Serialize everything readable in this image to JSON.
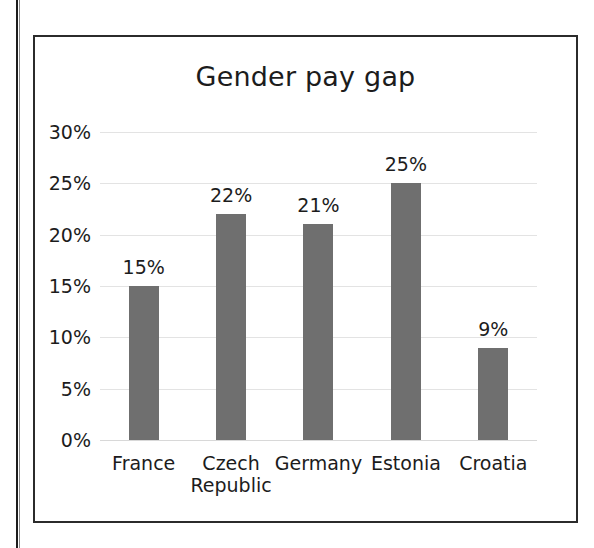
{
  "chart_data": {
    "type": "bar",
    "title": "Gender pay gap",
    "xlabel": "",
    "ylabel": "",
    "categories": [
      "France",
      "Czech Republic",
      "Germany",
      "Estonia",
      "Croatia"
    ],
    "category_lines": [
      [
        "France"
      ],
      [
        "Czech",
        "Republic"
      ],
      [
        "Germany"
      ],
      [
        "Estonia"
      ],
      [
        "Croatia"
      ]
    ],
    "values": [
      15,
      22,
      21,
      25,
      9
    ],
    "data_labels": [
      "15%",
      "22%",
      "21%",
      "25%",
      "9%"
    ],
    "ylim": [
      0,
      30
    ],
    "ytick_values": [
      30,
      25,
      20,
      15,
      10,
      5,
      0
    ],
    "ytick_labels": [
      "30%",
      "25%",
      "20%",
      "15%",
      "10%",
      "5%",
      "0%"
    ],
    "grid": "horizontal",
    "legend": "none",
    "bar_color": "#6f6f6f",
    "gridline_color": "#e3e3e3",
    "text_color": "#1c1c1c",
    "frame_color": "#2b2b2b",
    "background_color": "#ffffff",
    "units": "percent"
  }
}
